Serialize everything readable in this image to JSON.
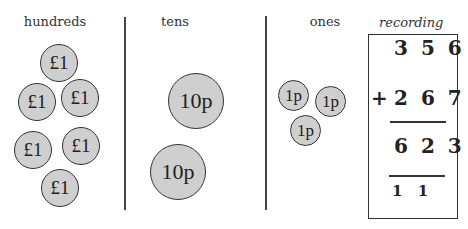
{
  "columns": {
    "hundreds": {
      "label": "hundreds",
      "coin_label": "£1",
      "count": 6
    },
    "tens": {
      "label": "tens",
      "coin_label": "10p",
      "count": 2
    },
    "ones": {
      "label": "ones",
      "coin_label": "1p",
      "count": 3
    }
  },
  "coins": {
    "c0": "£1",
    "c1": "£1",
    "c2": "£1",
    "c3": "£1",
    "c4": "£1",
    "c5": "£1",
    "t0": "10p",
    "t1": "10p",
    "o0": "1p",
    "o1": "1p",
    "o2": "1p"
  },
  "recording": {
    "title": "recording",
    "addend1": "3 5 6",
    "operator": "+",
    "addend2": "2 6 7",
    "sum": "6 2 3",
    "carries": "1 1"
  },
  "colors": {
    "coin_fill": "#cfcfcf",
    "line": "#333333",
    "background": "#ffffff"
  }
}
